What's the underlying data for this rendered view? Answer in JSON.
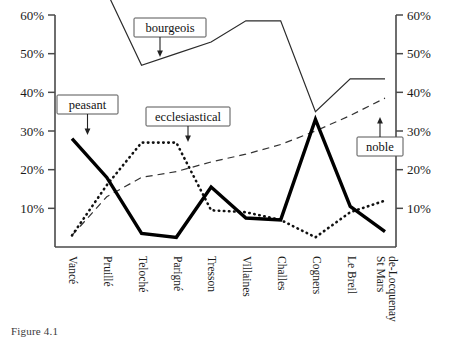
{
  "figure": {
    "caption": "Figure 4.1"
  },
  "axes": {
    "y_tick_labels": [
      "60%",
      "50%",
      "40%",
      "30%",
      "20%",
      "10%"
    ],
    "y_tick_values": [
      60,
      50,
      40,
      30,
      20,
      10
    ],
    "y_axis_left_label": "",
    "y_axis_right_label": "",
    "x_tick_labels": [
      "Vancé",
      "Pruillé",
      "Teloché",
      "Parigné",
      "Tresson",
      "Villaines",
      "Challes",
      "Cogners",
      "Le Breil",
      "St Mars",
      "de-Locquenay"
    ]
  },
  "annotations": [
    {
      "id": "peasant",
      "label": "peasant"
    },
    {
      "id": "bourgeois",
      "label": "bourgeois"
    },
    {
      "id": "ecclesiastical",
      "label": "ecclesiastical"
    },
    {
      "id": "noble",
      "label": "noble"
    }
  ],
  "colors": {
    "peasant": "#000000",
    "bourgeois": "#2b2b2b",
    "ecclesiastical": "#111111",
    "noble": "#333333",
    "axis": "#4a4a4a",
    "background": "#ffffff"
  },
  "chart_data": {
    "type": "line",
    "title": "",
    "xlabel": "",
    "ylabel": "",
    "ylim": [
      0,
      60
    ],
    "grid": false,
    "legend": "inline-annotations",
    "categories": [
      "Vancé",
      "Pruillé",
      "Teloché",
      "Parigné",
      "Tresson",
      "Villaines",
      "Challes",
      "Cogners",
      "Le Breil",
      "St Mars de-Locquenay"
    ],
    "series": [
      {
        "name": "peasant",
        "style": "thick-solid",
        "values": [
          28,
          18,
          3.5,
          2.5,
          15.5,
          7.5,
          7,
          33,
          10.5,
          4
        ]
      },
      {
        "name": "bourgeois",
        "style": "thin-solid",
        "values": [
          null,
          66,
          47,
          50,
          53,
          58.5,
          58.5,
          35,
          43.5,
          43.5
        ]
      },
      {
        "name": "ecclesiastical",
        "style": "dotted",
        "values": [
          3,
          16,
          27,
          27,
          9.5,
          9,
          7,
          2.5,
          9,
          12
        ]
      },
      {
        "name": "noble",
        "style": "dashed",
        "values": [
          3,
          13,
          18,
          19.5,
          22,
          24,
          26.5,
          30,
          34,
          38.5
        ]
      }
    ]
  }
}
